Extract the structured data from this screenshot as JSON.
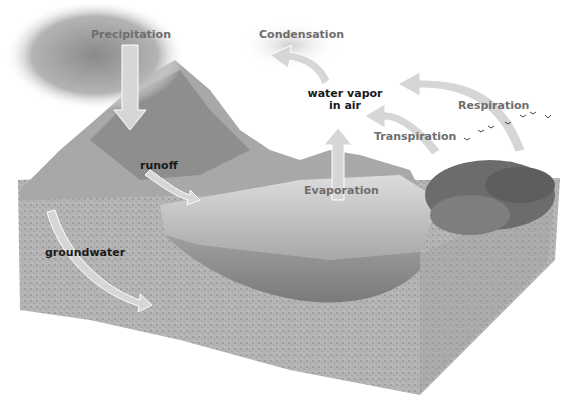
{
  "diagram": {
    "type": "water cycle illustration",
    "labels": {
      "precipitation": "Precipitation",
      "condensation": "Condensation",
      "water_vapor_line1": "water vapor",
      "water_vapor_line2": "in air",
      "respiration": "Respiration",
      "transpiration": "Transpiration",
      "evaporation": "Evaporation",
      "runoff": "runoff",
      "groundwater": "groundwater"
    },
    "colors": {
      "process_label": "#6e6e6e",
      "state_label": "#1a1a1a",
      "arrow": "#d0d0d0",
      "soil": "#a8a8a8",
      "water": "#bdbdbd",
      "cloud": "#9a9a9a"
    }
  }
}
